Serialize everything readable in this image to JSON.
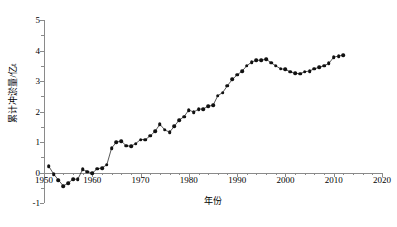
{
  "chart_data": {
    "type": "scatter",
    "title": "",
    "xlabel": "年份",
    "ylabel": "累计冲淤量/亿t",
    "xlim": [
      1950,
      2020
    ],
    "ylim": [
      -1,
      5
    ],
    "xticks": [
      1950,
      1960,
      1970,
      1980,
      1990,
      2000,
      2010,
      2020
    ],
    "yticks": [
      -1,
      0,
      1,
      2,
      3,
      4,
      5
    ],
    "grid": false,
    "legend": null,
    "marker": "filled-circle",
    "marker_color": "#111111",
    "axis_color": "#8a8a8a",
    "x": [
      1951,
      1952,
      1953,
      1954,
      1955,
      1956,
      1957,
      1958,
      1959,
      1960,
      1961,
      1962,
      1963,
      1964,
      1965,
      1966,
      1967,
      1968,
      1969,
      1970,
      1971,
      1972,
      1973,
      1974,
      1975,
      1976,
      1977,
      1978,
      1979,
      1980,
      1981,
      1982,
      1983,
      1984,
      1985,
      1986,
      1987,
      1988,
      1989,
      1990,
      1991,
      1992,
      1993,
      1994,
      1995,
      1996,
      1997,
      1998,
      1999,
      2000,
      2001,
      2002,
      2003,
      2004,
      2005,
      2006,
      2007,
      2008,
      2009,
      2010,
      2011,
      2012
    ],
    "y": [
      0.2,
      -0.05,
      -0.25,
      -0.44,
      -0.35,
      -0.22,
      -0.22,
      0.1,
      0.03,
      -0.02,
      0.12,
      0.15,
      0.25,
      0.8,
      1.0,
      1.03,
      0.88,
      0.86,
      0.95,
      1.08,
      1.08,
      1.2,
      1.35,
      1.58,
      1.4,
      1.32,
      1.52,
      1.72,
      1.83,
      2.05,
      1.98,
      2.08,
      2.08,
      2.18,
      2.2,
      2.52,
      2.62,
      2.85,
      3.05,
      3.2,
      3.32,
      3.5,
      3.62,
      3.68,
      3.68,
      3.72,
      3.6,
      3.5,
      3.4,
      3.38,
      3.3,
      3.25,
      3.24,
      3.3,
      3.33,
      3.4,
      3.45,
      3.5,
      3.58,
      3.78,
      3.82,
      3.85
    ],
    "xtick_labels": [
      "1950",
      "1960",
      "1970",
      "1980",
      "1990",
      "2000",
      "2010",
      "2020"
    ],
    "ytick_labels": [
      "-1",
      "0",
      "1",
      "2",
      "3",
      "4",
      "5"
    ]
  }
}
